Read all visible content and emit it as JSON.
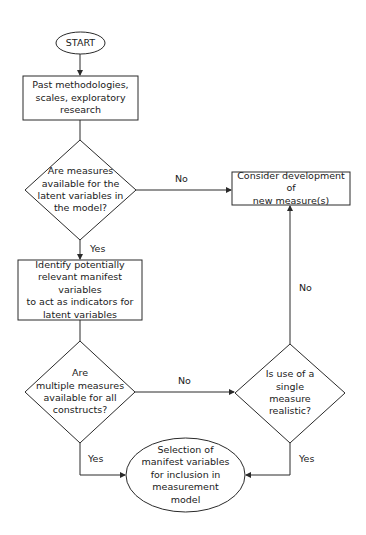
{
  "diagram": {
    "type": "flowchart",
    "nodes": {
      "start": {
        "shape": "oval",
        "label": "START"
      },
      "past": {
        "shape": "rect",
        "label": "Past methodologies,\nscales, exploratory\nresearch"
      },
      "q1": {
        "shape": "diamond",
        "label": "Are measures\navailable for the\nlatent variables in\nthe model?"
      },
      "consider": {
        "shape": "rect",
        "label": "Consider development of\nnew measure(s)"
      },
      "identify": {
        "shape": "rect",
        "label": "Identify potentially\nrelevant manifest variables\nto act as indicators for\nlatent variables"
      },
      "q2": {
        "shape": "diamond",
        "label": "Are\nmultiple measures\navailable for all\nconstructs?"
      },
      "q3": {
        "shape": "diamond",
        "label": "Is use of a\nsingle\nmeasure\nrealistic?"
      },
      "end": {
        "shape": "oval",
        "label": "Selection of\nmanifest variables\nfor inclusion in\nmeasurement\nmodel"
      }
    },
    "edges": [
      {
        "from": "start",
        "to": "past",
        "label": ""
      },
      {
        "from": "past",
        "to": "q1",
        "label": ""
      },
      {
        "from": "q1",
        "to": "consider",
        "label": "No"
      },
      {
        "from": "q1",
        "to": "identify",
        "label": "Yes"
      },
      {
        "from": "identify",
        "to": "q2",
        "label": ""
      },
      {
        "from": "q2",
        "to": "q3",
        "label": "No"
      },
      {
        "from": "q2",
        "to": "end",
        "label": "Yes"
      },
      {
        "from": "q3",
        "to": "consider",
        "label": "No"
      },
      {
        "from": "q3",
        "to": "end",
        "label": "Yes"
      }
    ],
    "labels": {
      "q1_no": "No",
      "q1_yes": "Yes",
      "q2_no": "No",
      "q2_yes": "Yes",
      "q3_no": "No",
      "q3_yes": "Yes"
    },
    "colors": {
      "stroke": "#2a2a2a",
      "background": "#ffffff",
      "text": "#1a1a1a"
    }
  }
}
